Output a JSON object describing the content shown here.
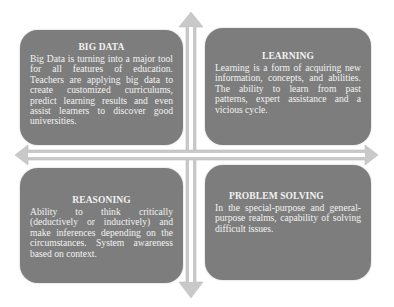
{
  "diagram": {
    "colors": {
      "box_fill": "#7d7d7d",
      "text": "#f2f2f2",
      "arrow_fill": "#c9c9c9",
      "arrow_core": "#ffffff",
      "background": "#ffffff"
    },
    "quadrants": [
      {
        "id": "big-data",
        "position": "top-left",
        "title": "BIG DATA",
        "body": "Big Data is turning into a major tool for all features of education. Teachers are applying big data to create customized curriculums, predict learning results and even assist learners to discover good universities."
      },
      {
        "id": "learning",
        "position": "top-right",
        "title": "LEARNING",
        "body": "Learning is a form of acquiring new information, concepts, and abilities. The ability to learn from past patterns, expert assistance and a vicious cycle."
      },
      {
        "id": "reasoning",
        "position": "bottom-left",
        "title": "REASONING",
        "body": "Ability to think critically (deductively or inductively) and make inferences depending on the circumstances. System awareness based on context."
      },
      {
        "id": "problem-solving",
        "position": "bottom-right",
        "title": "PROBLEM SOLVING",
        "body": "In the special-purpose and general-purpose realms, capability of solving difficult issues."
      }
    ],
    "axes": {
      "vertical": "double-headed arrow (up/down)",
      "horizontal": "double-headed arrow (left/right)"
    }
  }
}
